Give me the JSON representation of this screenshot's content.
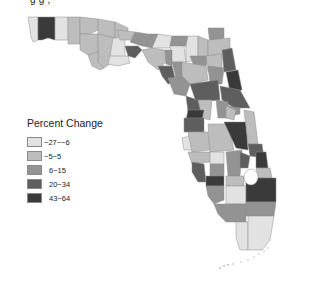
{
  "title_partial": "g                                                    g      ,",
  "legend": {
    "title": "Percent Change",
    "items": [
      {
        "label": "−27−−6",
        "color": "#e2e2e2"
      },
      {
        "label": "−5−5",
        "color": "#bdbdbd"
      },
      {
        "label": "6−15",
        "color": "#939393"
      },
      {
        "label": "20−34",
        "color": "#5e5e5e"
      },
      {
        "label": "43−64",
        "color": "#3a3a3a"
      }
    ]
  },
  "map": {
    "region": "Florida counties",
    "classes": {
      "c1": "#e2e2e2",
      "c2": "#bdbdbd",
      "c3": "#939393",
      "c4": "#5e5e5e",
      "c5": "#3a3a3a"
    }
  }
}
